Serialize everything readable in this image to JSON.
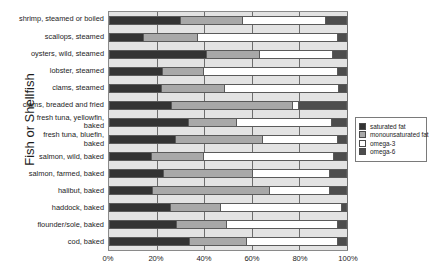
{
  "chart_data": {
    "type": "bar",
    "subtype": "stacked-horizontal-100-percent",
    "title": "",
    "xlabel": "",
    "ylabel": "Fish or Shellfish",
    "xlim": [
      0,
      100
    ],
    "xticks": [
      "0%",
      "20%",
      "40%",
      "60%",
      "80%",
      "100%"
    ],
    "xtick_values": [
      0,
      20,
      40,
      60,
      80,
      100
    ],
    "grid": true,
    "legend_position": "right",
    "categories": [
      "shrimp, steamed or boiled",
      "scallops, steamed",
      "oysters, wild, steamed",
      "lobster, steamed",
      "clams, steamed",
      "clams, breaded and fried",
      "fresh tuna, yellowfin,\nbaked",
      "fresh tuna, bluefin,\nbaked",
      "salmon, wild, baked",
      "salmon, farmed, baked",
      "halibut, baked",
      "haddock, baked",
      "flounder/sole, baked",
      "cod, baked"
    ],
    "series": [
      {
        "name": "saturated fat",
        "color": "#333333",
        "values": [
          29.5,
          14.0,
          40.5,
          22.0,
          21.5,
          26.0,
          33.0,
          27.5,
          17.5,
          22.5,
          18.0,
          25.5,
          28.0,
          33.5
        ]
      },
      {
        "name": "monounsaturated fat",
        "color": "#a8a8a8",
        "values": [
          26.5,
          23.0,
          22.5,
          17.5,
          27.0,
          51.0,
          20.5,
          37.0,
          22.0,
          37.5,
          49.5,
          21.0,
          21.0,
          24.0
        ]
      },
      {
        "name": "omega-3",
        "color": "#ffffff",
        "values": [
          35.0,
          59.0,
          31.0,
          56.5,
          48.0,
          2.5,
          40.0,
          31.5,
          55.0,
          33.0,
          25.5,
          51.5,
          47.0,
          38.5
        ]
      },
      {
        "name": "omega-6",
        "color": "#4d4d4d",
        "values": [
          9.0,
          4.0,
          6.0,
          4.0,
          3.5,
          20.5,
          6.5,
          4.0,
          5.5,
          7.0,
          7.0,
          2.0,
          4.0,
          4.0
        ]
      }
    ]
  },
  "legend": {
    "items": [
      {
        "label": "saturated fat",
        "color": "#333333"
      },
      {
        "label": "monounsaturated fat",
        "color": "#a8a8a8"
      },
      {
        "label": "omega-3",
        "color": "#ffffff"
      },
      {
        "label": "omega-6",
        "color": "#4d4d4d"
      }
    ]
  }
}
